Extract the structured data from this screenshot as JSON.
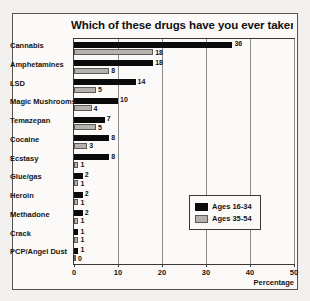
{
  "chart_data": {
    "type": "bar",
    "orientation": "horizontal",
    "title": "Which of these drugs have you ever taken ?",
    "xlabel": "Percentage",
    "ylabel": "",
    "xlim": [
      0,
      50
    ],
    "xticks": [
      0,
      10,
      20,
      30,
      40,
      50
    ],
    "grid": true,
    "legend_position": "center-right",
    "categories": [
      "Cannabis",
      "Amphetamines",
      "LSD",
      "Magic Mushrooms",
      "Temazepan",
      "Cocaine",
      "Ecstasy",
      "Glue/gas",
      "Heroin",
      "Methadone",
      "Crack",
      "PCP/Angel Dust"
    ],
    "series": [
      {
        "name": "Ages 16-34",
        "color": "#0b0b0b",
        "values": [
          36,
          18,
          14,
          10,
          7,
          8,
          8,
          2,
          2,
          2,
          1,
          1
        ]
      },
      {
        "name": "Ages 35-54",
        "color": "#b4b2ae",
        "values": [
          18,
          8,
          5,
          4,
          5,
          3,
          1,
          1,
          1,
          1,
          1,
          0
        ]
      }
    ]
  }
}
